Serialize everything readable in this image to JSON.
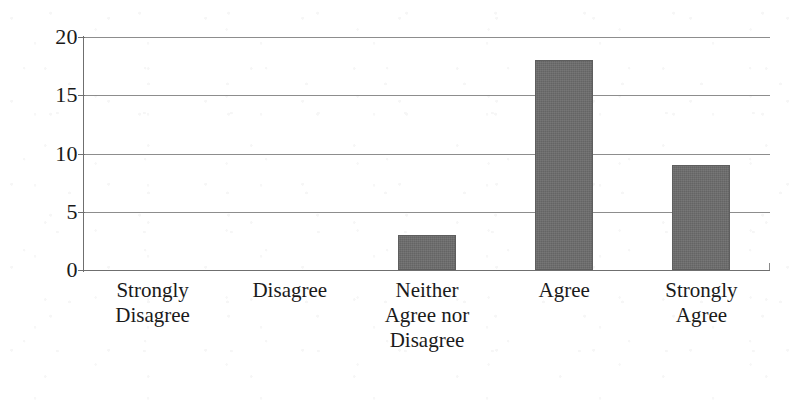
{
  "chart_data": {
    "type": "bar",
    "title": "",
    "subtitle": "",
    "xlabel": "",
    "ylabel": "",
    "categories": [
      "Strongly Disagree",
      "Disagree",
      "Neither Agree nor Disagree",
      "Agree",
      "Strongly Agree"
    ],
    "category_lines": [
      [
        "Strongly",
        "Disagree"
      ],
      [
        "Disagree"
      ],
      [
        "Neither",
        "Agree nor",
        "Disagree"
      ],
      [
        "Agree"
      ],
      [
        "Strongly",
        "Agree"
      ]
    ],
    "values": [
      0,
      0,
      3,
      18,
      9
    ],
    "ylim": [
      0,
      20
    ],
    "y_ticks": [
      0,
      5,
      10,
      15,
      20
    ],
    "y_tick_labels": [
      "0",
      "5",
      "10",
      "15",
      "20"
    ],
    "grid": true,
    "grid_axis": "y",
    "legend": false,
    "legend_position": "none",
    "bar_color": "#6b6b6b",
    "grid_color": "#8d8d8d",
    "axis_color": "#6f6f6f",
    "text_color": "#1a1a1a",
    "background_color": "#ffffff"
  }
}
